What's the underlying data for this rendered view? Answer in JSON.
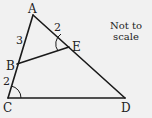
{
  "diagram": {
    "type": "geometry-triangle",
    "points": {
      "A": {
        "label": "A",
        "x": 33,
        "y": 15
      },
      "B": {
        "label": "B",
        "x": 17,
        "y": 64
      },
      "C": {
        "label": "C",
        "x": 8,
        "y": 98
      },
      "D": {
        "label": "D",
        "x": 125,
        "y": 98
      },
      "E": {
        "label": "E",
        "x": 69,
        "y": 47
      }
    },
    "segments": [
      {
        "from": "A",
        "to": "C"
      },
      {
        "from": "A",
        "to": "D"
      },
      {
        "from": "C",
        "to": "D"
      },
      {
        "from": "B",
        "to": "E"
      }
    ],
    "lengths": {
      "AB": "3",
      "AE": "2",
      "BC": "2"
    },
    "marked_angles": [
      "AEB",
      "ACD"
    ],
    "note_line1": "Not to",
    "note_line2": "scale"
  }
}
